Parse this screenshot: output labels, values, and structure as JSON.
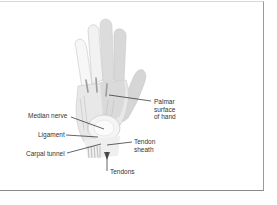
{
  "diagram": {
    "labels": {
      "palmar_surface": [
        "Palmar",
        "surface",
        "of hand"
      ],
      "median_nerve": "Median nerve",
      "ligament": "Ligament",
      "carpal_tunnel": "Carpal tunnel",
      "tendon_sheath": [
        "Tendon",
        "sheath"
      ],
      "tendons": "Tendons"
    },
    "colors": {
      "hand_fill": "#e6e6e6",
      "hand_shade": "#cfcfcf",
      "tendon": "#a8a8a8",
      "leader_line": "#222222",
      "frame_right": "#9a9a9a",
      "frame_bottom": "#8a8a8a"
    }
  }
}
